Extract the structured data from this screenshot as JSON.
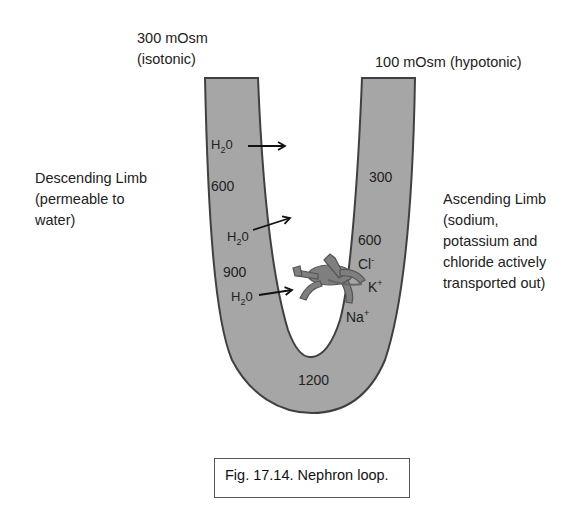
{
  "top_left_label": {
    "line1": "300 mOsm",
    "line2": "(isotonic)"
  },
  "top_right_label": "100 mOsm (hypotonic)",
  "descending_limb_label": {
    "line1": "Descending Limb",
    "line2": "(permeable to",
    "line3": "water)"
  },
  "ascending_limb_label": {
    "line1": "Ascending Limb",
    "line2": "(sodium,",
    "line3": "potassium and",
    "line4": "chloride actively",
    "line5": "transported out)"
  },
  "descending_values": [
    "600",
    "900"
  ],
  "ascending_values": [
    "300",
    "600"
  ],
  "bottom_value": "1200",
  "water_label": {
    "main": "H",
    "sub": "2",
    "end": "0"
  },
  "ions": {
    "chloride": {
      "symbol": "Cl",
      "charge": "-"
    },
    "potassium": {
      "symbol": "K",
      "charge": "+"
    },
    "sodium": {
      "symbol": "Na",
      "charge": "+"
    }
  },
  "caption": "Fig. 17.14. Nephron loop.",
  "colors": {
    "tubule_fill": "#a6a6a6",
    "tubule_stroke": "#404040",
    "pump_fill": "#7f7f7f"
  }
}
